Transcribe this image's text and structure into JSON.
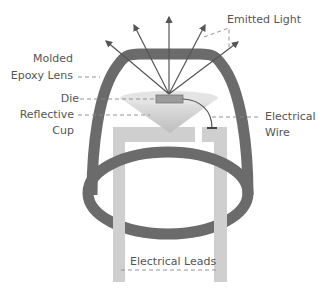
{
  "diagram": {
    "labels": {
      "emitted_light": "Emitted Light",
      "molded_line1": "Molded",
      "molded_line2": "Epoxy Lens",
      "die": "Die",
      "reflective_line1": "Reflective",
      "reflective_line2": "Cup",
      "wire_line1": "Electrical",
      "wire_line2": "Wire",
      "leads": "Electrical Leads"
    },
    "colors": {
      "lens": "#6b6b6b",
      "leads": "#cfcfcf",
      "cup": "#d8d8d8",
      "die": "#9a9a9a",
      "rays": "#555555",
      "text": "#555555"
    }
  }
}
